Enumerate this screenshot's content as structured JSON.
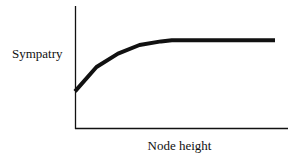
{
  "chart_data": {
    "type": "line",
    "title": "",
    "xlabel": "Node height",
    "ylabel": "Sympatry",
    "grid": false,
    "legend": null,
    "axis_ticks": false,
    "x": [
      0,
      0.1,
      0.2,
      0.3,
      0.4,
      0.45,
      0.5,
      0.6,
      0.7,
      0.8,
      0.9,
      0.93
    ],
    "series": [
      {
        "name": "Sympatry",
        "values": [
          0.3,
          0.5,
          0.61,
          0.68,
          0.71,
          0.72,
          0.72,
          0.72,
          0.72,
          0.72,
          0.72,
          0.72
        ]
      }
    ],
    "xlim": [
      0,
      1
    ],
    "ylim": [
      0,
      1
    ]
  },
  "labels": {
    "ylabel": "Sympatry",
    "xlabel": "Node height"
  }
}
